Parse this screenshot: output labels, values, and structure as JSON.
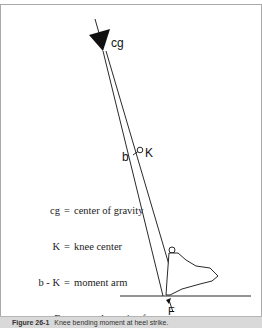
{
  "diagram": {
    "labels": {
      "cg": "cg",
      "knee": "K",
      "b": "b",
      "force": "F"
    },
    "legend": [
      {
        "key": "cg",
        "desc": "center of gravity"
      },
      {
        "key": "K",
        "desc": "knee center"
      },
      {
        "key": "b - K",
        "desc": "moment arm"
      },
      {
        "key": "F",
        "desc": "ground reactive force"
      }
    ],
    "caption": {
      "number": "Figure 26-1",
      "text": "Knee bending moment at heel strike."
    },
    "colors": {
      "line": "#111111",
      "frame": "#a9a9a9",
      "caption_bg": "#d9d9d9"
    }
  }
}
